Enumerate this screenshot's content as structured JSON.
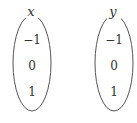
{
  "sets": [
    {
      "label": "x",
      "elements": [
        "−1",
        "0",
        "1"
      ]
    },
    {
      "label": "y",
      "elements": [
        "−1",
        "0",
        "1"
      ]
    }
  ],
  "colors": {
    "stroke": "#555555",
    "text": "#333333"
  }
}
